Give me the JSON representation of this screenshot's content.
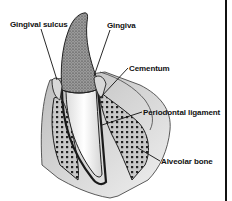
{
  "diagram": {
    "labels": [
      {
        "id": "gingival-sulcus",
        "text": "Gingival sulcus"
      },
      {
        "id": "gingiva",
        "text": "Gingiva"
      },
      {
        "id": "cementum",
        "text": "Cementum"
      },
      {
        "id": "periodontal-ligament",
        "text": "Periodontal ligament"
      },
      {
        "id": "alveolar-bone",
        "text": "Alveolar bone"
      }
    ],
    "colors": {
      "ink": "#111111",
      "background": "#ffffff",
      "enamel_shade": "#8a8a8a",
      "root_fill": "#f2f2f2",
      "bone_fill": "#d0d0d0",
      "gum_fill": "#e4e4e4"
    }
  }
}
